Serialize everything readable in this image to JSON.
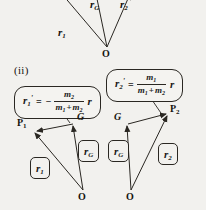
{
  "figure": {
    "part_label": "(ii)",
    "points": {
      "origin": "O",
      "centre_of_mass": "G",
      "particle1": "P",
      "particle1_sub": "1",
      "particle2": "P",
      "particle2_sub": "2"
    },
    "vectors": {
      "r1": {
        "symbol": "r",
        "sub": "1"
      },
      "rG": {
        "symbol": "r",
        "sub": "G"
      },
      "r2": {
        "symbol": "r",
        "sub": "2"
      }
    },
    "top_diagram": {
      "labels": [
        {
          "name": "r1-label",
          "symbol": "r",
          "sub": "1"
        },
        {
          "name": "rG-label",
          "symbol": "r",
          "sub": "G"
        },
        {
          "name": "r2-label",
          "symbol": "r",
          "sub": "2"
        }
      ],
      "origin_label": "O"
    },
    "formula_left": {
      "lhs_symbol": "r",
      "lhs_sub": "1",
      "lhs_prime": "'",
      "equals": "=",
      "sign": "−",
      "numerator_symbol": "m",
      "numerator_sub": "2",
      "denominator_first_symbol": "m",
      "denominator_first_sub": "1",
      "denominator_plus": "+",
      "denominator_second_symbol": "m",
      "denominator_second_sub": "2",
      "rhs_symbol": "r"
    },
    "formula_right": {
      "lhs_symbol": "r",
      "lhs_sub": "2",
      "lhs_prime": "'",
      "equals": "=",
      "numerator_symbol": "m",
      "numerator_sub": "1",
      "denominator_first_symbol": "m",
      "denominator_first_sub": "1",
      "denominator_plus": "+",
      "denominator_second_symbol": "m",
      "denominator_second_sub": "2",
      "rhs_symbol": "r"
    },
    "left_triangle": {
      "apex_left_point": "P",
      "apex_left_sub": "1",
      "apex_right_point": "G",
      "bottom_point": "O",
      "vector_label_outer": {
        "symbol": "r",
        "sub": "1"
      },
      "vector_label_inner": {
        "symbol": "r",
        "sub": "G"
      }
    },
    "right_triangle": {
      "apex_left_point": "G",
      "apex_right_point": "P",
      "apex_right_sub": "2",
      "bottom_point": "O",
      "vector_label_inner": {
        "symbol": "r",
        "sub": "G"
      },
      "vector_label_outer": {
        "symbol": "r",
        "sub": "2"
      }
    },
    "colors": {
      "background": "#f2f1ee",
      "ink": "#2a2722",
      "text": "#15130f"
    }
  }
}
